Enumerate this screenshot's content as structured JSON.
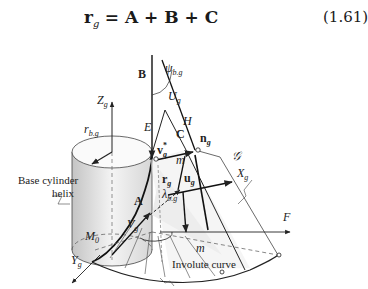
{
  "equation": {
    "lhs": "r",
    "lhs_sub": "g",
    "rhs": "= A + B + C",
    "number": "(1.61)"
  },
  "labels": {
    "B": "B",
    "psi": "ψ",
    "psi_sub": "b.g",
    "U": "U",
    "U_sub": "g",
    "Z": "Z",
    "Z_sub": "g",
    "E": "E",
    "H": "H",
    "C": "C",
    "n": "n",
    "n_sub": "g",
    "rb": "r",
    "rb_sub": "b.g",
    "v": "v",
    "v_sup": "*",
    "v_sub": "g",
    "m_top": "m",
    "script_g": "𝒢",
    "X": "X",
    "X_sub": "g",
    "r": "r",
    "r_sub": "g",
    "u": "u",
    "u_sub": "g",
    "lambda": "λ",
    "lambda_sub": "b.g",
    "A": "A",
    "V": "V",
    "V_sub": "g",
    "F": "F",
    "M0": "M",
    "M0_sub": "0",
    "m_bottom": "m",
    "Y": "Y",
    "Y_sub": "g"
  },
  "captions": {
    "base_cylinder_line1": "Base cylinder",
    "base_cylinder_line2": "helix",
    "involute_curve": "Involute curve"
  },
  "colors": {
    "stroke": "#222222",
    "cylinder_light": "#f2f2f2",
    "cylinder_dark": "#bdbdbd",
    "surface": "#e6e6e6"
  }
}
